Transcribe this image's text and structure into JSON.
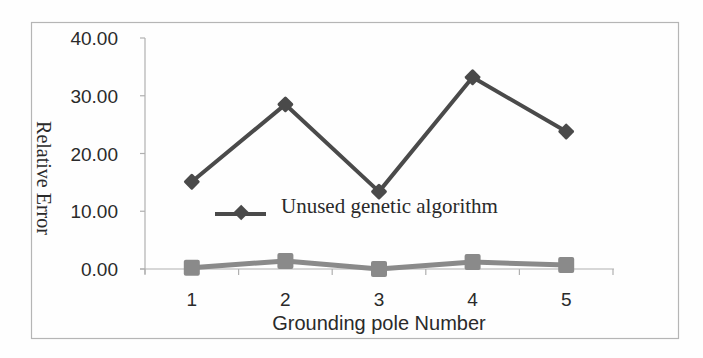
{
  "chart_data": {
    "type": "line",
    "title": "",
    "xlabel": "Grounding pole Number",
    "ylabel": "Relative Error",
    "categories": [
      "1",
      "2",
      "3",
      "4",
      "5"
    ],
    "ylim": [
      0,
      40
    ],
    "yticks": [
      "0.00",
      "10.00",
      "20.00",
      "30.00",
      "40.00"
    ],
    "grid": false,
    "legend_position": "inside-center",
    "series": [
      {
        "name": "Unused genetic algorithm",
        "marker": "diamond",
        "color": "#4a4a4a",
        "values": [
          15.1,
          28.5,
          13.4,
          33.2,
          23.8
        ]
      },
      {
        "name": "",
        "marker": "square",
        "color": "#8a8a8a",
        "values": [
          0.2,
          1.4,
          0.0,
          1.2,
          0.7
        ]
      }
    ]
  },
  "legend": {
    "items": [
      {
        "label": "Unused genetic algorithm"
      }
    ]
  },
  "axes": {
    "x_title": "Grounding pole Number",
    "y_title": "Relative Error"
  }
}
